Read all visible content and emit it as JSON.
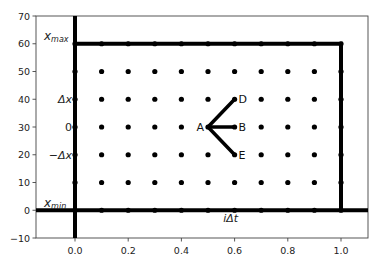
{
  "chart_data": {
    "type": "scatter",
    "title": "",
    "xlabel": "",
    "ylabel": "",
    "xlim": [
      -0.14,
      1.1
    ],
    "ylim": [
      -10,
      70
    ],
    "grid": false,
    "x_ticks": [
      "0.0",
      "0.2",
      "0.4",
      "0.6",
      "0.8",
      "1.0"
    ],
    "x_tick_values": [
      0.0,
      0.2,
      0.4,
      0.6,
      0.8,
      1.0
    ],
    "y_ticks": [
      "−10",
      "0",
      "10",
      "20",
      "30",
      "40",
      "50",
      "60",
      "70"
    ],
    "y_tick_values": [
      -10,
      0,
      10,
      20,
      30,
      40,
      50,
      60,
      70
    ],
    "grid_points": {
      "x": [
        0.0,
        0.1,
        0.2,
        0.3,
        0.4,
        0.5,
        0.6,
        0.7,
        0.8,
        0.9,
        1.0
      ],
      "y": [
        0,
        10,
        20,
        30,
        40,
        50,
        60
      ]
    },
    "boundary_rectangle": {
      "x0": 0.0,
      "x1": 1.0,
      "y0": 0,
      "y1": 60
    },
    "axis_lines": {
      "vertical_at_x": 0.0,
      "horizontal_at_y": 0
    },
    "stencil": {
      "points": [
        {
          "label": "A",
          "x": 0.5,
          "y": 30
        },
        {
          "label": "B",
          "x": 0.6,
          "y": 30
        },
        {
          "label": "D",
          "x": 0.6,
          "y": 40
        },
        {
          "label": "E",
          "x": 0.6,
          "y": 20
        }
      ],
      "edges": [
        [
          "A",
          "B"
        ],
        [
          "A",
          "D"
        ],
        [
          "A",
          "E"
        ]
      ]
    },
    "annotations": [
      {
        "text": "x_max",
        "display": "x",
        "sub": "max",
        "x": -0.11,
        "y": 62
      },
      {
        "text": "x_min",
        "display": "x",
        "sub": "min",
        "x": -0.11,
        "y": 2
      },
      {
        "text": "Δx",
        "x": -0.07,
        "y": 40
      },
      {
        "text": "0",
        "x": -0.02,
        "y": 30
      },
      {
        "text": "−Δx",
        "x": -0.11,
        "y": 20
      },
      {
        "text": "iΔt",
        "x": 0.58,
        "y": -3
      }
    ]
  }
}
